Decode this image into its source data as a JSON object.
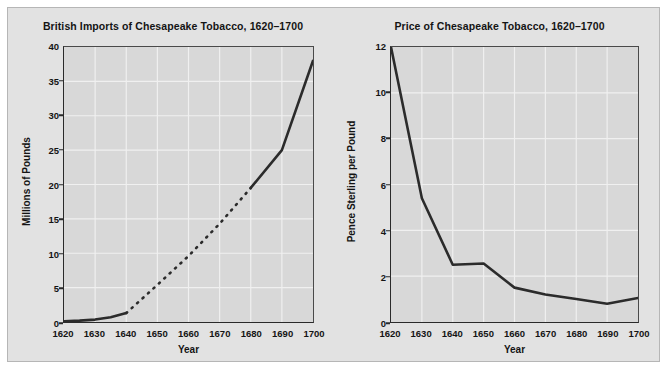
{
  "figure": {
    "background": "#e2e2e2",
    "plot_background": "#d8d8d8",
    "line_color": "#2b2b2b",
    "grid_color": "#f0f0f0"
  },
  "chart_data": [
    {
      "id": "imports",
      "type": "line",
      "title": "British Imports of Chesapeake Tobacco, 1620–1700",
      "xlabel": "Year",
      "ylabel": "Millions of Pounds",
      "xlim": [
        1620,
        1700
      ],
      "ylim": [
        0,
        40
      ],
      "xticks": [
        1620,
        1630,
        1640,
        1650,
        1660,
        1670,
        1680,
        1690,
        1700
      ],
      "yticks": [
        0,
        5,
        10,
        15,
        20,
        25,
        30,
        35,
        40
      ],
      "grid": true,
      "legend": "none",
      "series": [
        {
          "name": "Imports (documented)",
          "style": "solid",
          "x": [
            1620,
            1625,
            1630,
            1635,
            1640
          ],
          "values": [
            0.1,
            0.2,
            0.35,
            0.7,
            1.3
          ]
        },
        {
          "name": "Imports (estimated)",
          "style": "dashed",
          "x": [
            1640,
            1650,
            1660,
            1670,
            1680
          ],
          "values": [
            1.3,
            5.4,
            9.6,
            14.3,
            19.5
          ]
        },
        {
          "name": "Imports (documented, late)",
          "style": "solid",
          "x": [
            1680,
            1690,
            1700
          ],
          "values": [
            19.5,
            25.0,
            38.0
          ]
        }
      ]
    },
    {
      "id": "price",
      "type": "line",
      "title": "Price of Chesapeake Tobacco, 1620–1700",
      "xlabel": "Year",
      "ylabel": "Pence Sterling per Pound",
      "xlim": [
        1620,
        1700
      ],
      "ylim": [
        0,
        12
      ],
      "xticks": [
        1620,
        1630,
        1640,
        1650,
        1660,
        1670,
        1680,
        1690,
        1700
      ],
      "yticks": [
        0,
        2,
        4,
        6,
        8,
        10,
        12
      ],
      "grid": true,
      "legend": "none",
      "series": [
        {
          "name": "Price",
          "style": "solid",
          "x": [
            1620,
            1630,
            1640,
            1650,
            1660,
            1670,
            1680,
            1690,
            1700
          ],
          "values": [
            12.0,
            5.4,
            2.5,
            2.55,
            1.5,
            1.2,
            1.0,
            0.8,
            1.05
          ]
        }
      ]
    }
  ]
}
